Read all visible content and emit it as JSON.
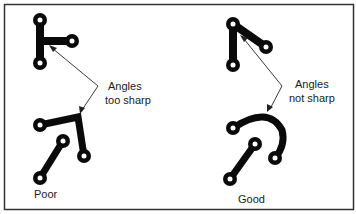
{
  "diagram": {
    "colors": {
      "trace": "#0a0a0a",
      "hole": "#ffffff",
      "frame": "#333333",
      "arrow": "#222222",
      "text": "#1a1a1a"
    },
    "callouts": [
      {
        "id": "poor-callout",
        "lines": [
          "Angles",
          "too sharp"
        ]
      },
      {
        "id": "good-callout",
        "lines": [
          "Angles",
          "not sharp"
        ]
      }
    ],
    "panels": [
      {
        "id": "poor",
        "label": "Poor"
      },
      {
        "id": "good",
        "label": "Good"
      }
    ]
  }
}
